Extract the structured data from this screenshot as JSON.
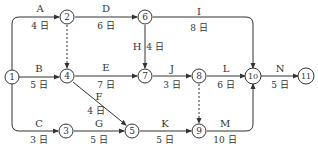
{
  "diagram": {
    "type": "activity-on-arrow network",
    "nodes": [
      {
        "id": "1",
        "x": 12,
        "y": 77
      },
      {
        "id": "2",
        "x": 67,
        "y": 17
      },
      {
        "id": "3",
        "x": 66,
        "y": 131
      },
      {
        "id": "4",
        "x": 67,
        "y": 76
      },
      {
        "id": "5",
        "x": 132,
        "y": 131
      },
      {
        "id": "6",
        "x": 145,
        "y": 17
      },
      {
        "id": "7",
        "x": 145,
        "y": 76
      },
      {
        "id": "8",
        "x": 199,
        "y": 76
      },
      {
        "id": "9",
        "x": 199,
        "y": 131
      },
      {
        "id": "10",
        "x": 253,
        "y": 76
      },
      {
        "id": "11",
        "x": 306,
        "y": 76
      }
    ],
    "activities": [
      {
        "name": "A",
        "duration": "4 日",
        "from": "1",
        "to": "2"
      },
      {
        "name": "B",
        "duration": "5 日",
        "from": "1",
        "to": "4"
      },
      {
        "name": "C",
        "duration": "3 日",
        "from": "1",
        "to": "3"
      },
      {
        "name": "D",
        "duration": "6 日",
        "from": "2",
        "to": "6"
      },
      {
        "name": "E",
        "duration": "7 日",
        "from": "4",
        "to": "7"
      },
      {
        "name": "F",
        "duration": "4 日",
        "from": "4",
        "to": "5"
      },
      {
        "name": "G",
        "duration": "5 日",
        "from": "3",
        "to": "5"
      },
      {
        "name": "H",
        "duration": "4 日",
        "from": "6",
        "to": "7"
      },
      {
        "name": "I",
        "duration": "8 日",
        "from": "6",
        "to": "10"
      },
      {
        "name": "J",
        "duration": "3 日",
        "from": "7",
        "to": "8"
      },
      {
        "name": "K",
        "duration": "5 日",
        "from": "5",
        "to": "9"
      },
      {
        "name": "L",
        "duration": "6 日",
        "from": "8",
        "to": "10"
      },
      {
        "name": "M",
        "duration": "10 日",
        "from": "9",
        "to": "10"
      },
      {
        "name": "N",
        "duration": "5 日",
        "from": "10",
        "to": "11"
      }
    ],
    "dummies": [
      {
        "from": "2",
        "to": "4"
      },
      {
        "from": "8",
        "to": "9"
      }
    ]
  }
}
